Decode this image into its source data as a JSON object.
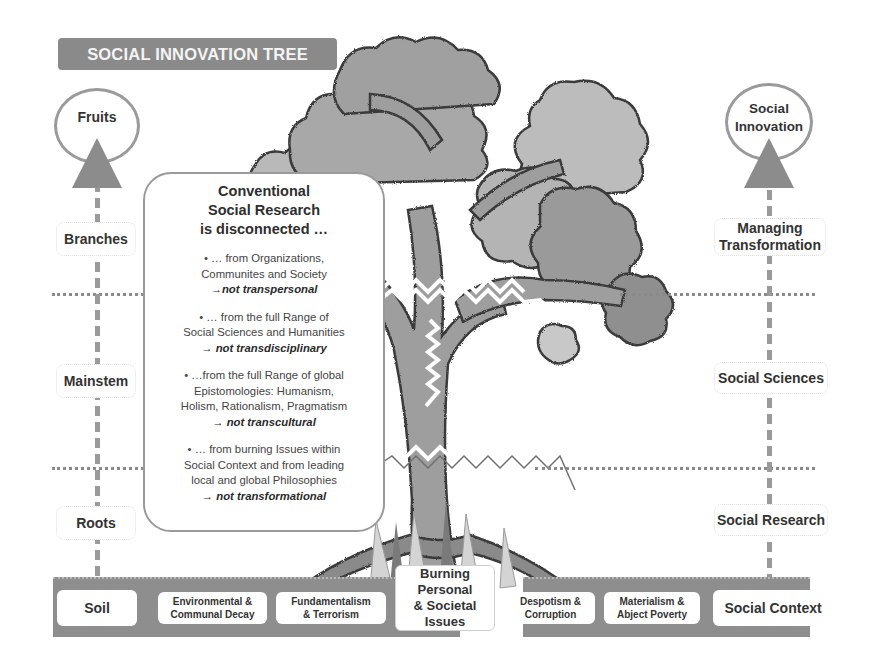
{
  "title": "SOCIAL INNOVATION TREE",
  "left_axis": {
    "top_circle": "Fruits",
    "labels": [
      "Branches",
      "Mainstem",
      "Roots"
    ],
    "soil": "Soil"
  },
  "right_axis": {
    "top_circle": "Social Innovation",
    "labels": [
      "Managing Transformation",
      "Social Sciences",
      "Social Research"
    ],
    "soil": "Social Context"
  },
  "callout": {
    "heading_lines": [
      "Conventional",
      "Social Research",
      "is disconnected …"
    ],
    "items": [
      {
        "lines": [
          "• … from Organizations,",
          "Communites and Society"
        ],
        "emphasis": "→not transpersonal"
      },
      {
        "lines": [
          "• … from the full Range of",
          "Social Sciences and Humanities"
        ],
        "emphasis": "→ not transdisciplinary"
      },
      {
        "lines": [
          "• …from the full Range of global",
          "Epistomologies: Humanism,",
          "Holism, Rationalism, Pragmatism"
        ],
        "emphasis": "→ not transcultural"
      },
      {
        "lines": [
          "• … from burning Issues within",
          "Social Context and from leading",
          "local and global Philosophies"
        ],
        "emphasis": "→ not transformational"
      }
    ]
  },
  "soil_issues": [
    {
      "line1": "Environmental &",
      "line2": "Communal Decay"
    },
    {
      "line1": "Fundamentalism",
      "line2": "& Terrorism"
    },
    {
      "line1": "Despotism &",
      "line2": "Corruption"
    },
    {
      "line1": "Materialism &",
      "line2": "Abject Poverty"
    }
  ],
  "center_issue": [
    "Burning",
    "Personal",
    "& Societal",
    "Issues"
  ],
  "colors": {
    "banner": "#8a8a8a",
    "soil": "#8e8e8e",
    "foliage_light": "#b5b5b5",
    "foliage_dark": "#8f8f8f",
    "trunk": "#999999",
    "outline": "#3a3a3a"
  }
}
